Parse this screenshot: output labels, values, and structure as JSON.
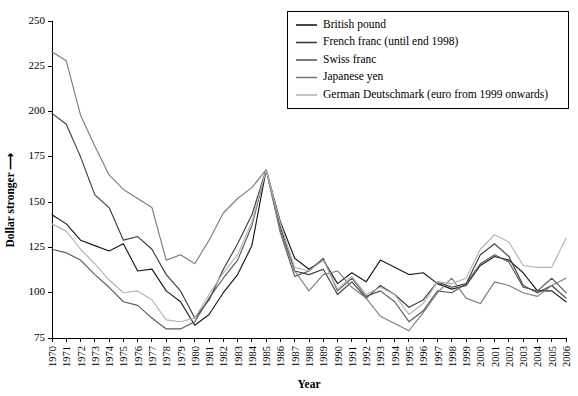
{
  "chart_data": {
    "type": "line",
    "title": "",
    "subtitle": "",
    "xlabel": "Year",
    "ylabel": "Dollar stronger",
    "ylabel_arrow": "⟶",
    "xlim": [
      1970,
      2006
    ],
    "ylim": [
      75,
      250
    ],
    "yticks": [
      75,
      100,
      125,
      150,
      175,
      200,
      225,
      250
    ],
    "grid": false,
    "legend_position": "top-right",
    "x": [
      1970,
      1971,
      1972,
      1973,
      1974,
      1975,
      1976,
      1977,
      1978,
      1979,
      1980,
      1981,
      1982,
      1983,
      1984,
      1985,
      1986,
      1987,
      1988,
      1989,
      1990,
      1991,
      1992,
      1993,
      1994,
      1995,
      1996,
      1997,
      1998,
      1999,
      2000,
      2001,
      2002,
      2003,
      2004,
      2005,
      2006
    ],
    "categories": [
      "1970",
      "1971",
      "1972",
      "1973",
      "1974",
      "1975",
      "1976",
      "1977",
      "1978",
      "1979",
      "1980",
      "1981",
      "1982",
      "1983",
      "1984",
      "1985",
      "1986",
      "1987",
      "1988",
      "1989",
      "1990",
      "1991",
      "1992",
      "1993",
      "1994",
      "1995",
      "1996",
      "1997",
      "1998",
      "1999",
      "2000",
      "2001",
      "2002",
      "2003",
      "2004",
      "2005",
      "2006"
    ],
    "series": [
      {
        "name": "British pound",
        "color": "#1a1a1a",
        "values": [
          143,
          138,
          129,
          126,
          123,
          127,
          112,
          113,
          101,
          95,
          82,
          88,
          100,
          110,
          126,
          168,
          139,
          119,
          113,
          118,
          105,
          111,
          106,
          118,
          114,
          110,
          111,
          105,
          102,
          104,
          115,
          120,
          118,
          111,
          101,
          101,
          95
        ]
      },
      {
        "name": "French franc (until end 1998)",
        "color": "#3d3d3d",
        "values": [
          199,
          193,
          175,
          154,
          147,
          129,
          131,
          124,
          110,
          101,
          86,
          96,
          113,
          127,
          143,
          168,
          136,
          112,
          110,
          113,
          99,
          106,
          97,
          104,
          99,
          92,
          96,
          106,
          103,
          105,
          121,
          127,
          120,
          104,
          100,
          104,
          97
        ]
      },
      {
        "name": "Swiss franc",
        "color": "#5a5a5a",
        "values": [
          124,
          122,
          118,
          110,
          103,
          95,
          93,
          86,
          80,
          80,
          84,
          97,
          108,
          118,
          137,
          168,
          133,
          109,
          112,
          119,
          101,
          108,
          98,
          101,
          95,
          84,
          90,
          101,
          100,
          105,
          116,
          121,
          117,
          103,
          101,
          108,
          100
        ]
      },
      {
        "name": "Japanese yen",
        "color": "#7d7d7d",
        "values": [
          233,
          228,
          198,
          181,
          165,
          157,
          152,
          147,
          118,
          121,
          116,
          129,
          144,
          152,
          158,
          168,
          134,
          112,
          101,
          110,
          112,
          103,
          97,
          87,
          83,
          79,
          89,
          100,
          108,
          97,
          94,
          106,
          104,
          100,
          98,
          104,
          108
        ]
      },
      {
        "name": "German Deutschmark (euro from 1999 onwards)",
        "color": "#b4b4b4",
        "values": [
          138,
          134,
          124,
          116,
          107,
          100,
          101,
          96,
          85,
          84,
          86,
          99,
          111,
          121,
          139,
          168,
          138,
          114,
          112,
          118,
          102,
          109,
          99,
          103,
          99,
          88,
          94,
          106,
          105,
          108,
          124,
          132,
          128,
          115,
          114,
          114,
          130
        ]
      }
    ],
    "legend_entries": [
      "British pound",
      "French franc (until end 1998)",
      "Swiss franc",
      "Japanese yen",
      "German Deutschmark (euro from 1999 onwards)"
    ]
  }
}
